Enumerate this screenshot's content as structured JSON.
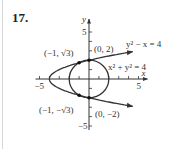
{
  "problem_number": "17.",
  "chart_data": {
    "type": "line",
    "title": "",
    "xlabel": "x",
    "ylabel": "y",
    "xlim": [
      -5,
      5
    ],
    "ylim": [
      -5,
      5
    ],
    "x_ticks": [
      -5,
      -4,
      -3,
      -2,
      -1,
      1,
      2,
      3,
      4,
      5
    ],
    "y_ticks": [
      -5,
      -4,
      -3,
      -2,
      -1,
      1,
      2,
      3,
      4,
      5
    ],
    "x_tick_labels": [
      {
        "value": -5,
        "label": "−5"
      },
      {
        "value": 5,
        "label": "5"
      }
    ],
    "y_tick_labels": [
      {
        "value": 5,
        "label": "5"
      },
      {
        "value": -5,
        "label": "−5"
      }
    ],
    "grid": false,
    "series": [
      {
        "name": "parabola",
        "equation": "y² − x = 4",
        "label": "y² − x = 4",
        "y_range": [
          -2.9,
          2.9
        ],
        "color": "#333333"
      },
      {
        "name": "circle",
        "equation": "x² + y² = 4",
        "label": "x² + y² = 4",
        "radius": 2,
        "color": "#333333"
      }
    ],
    "points": [
      {
        "x": -1,
        "y": 1.732,
        "label": "(−1, √3)"
      },
      {
        "x": 0,
        "y": 2,
        "label": "(0, 2)"
      },
      {
        "x": -1,
        "y": -1.732,
        "label": "(−1, −√3)"
      },
      {
        "x": 0,
        "y": -2,
        "label": "(0, −2)"
      }
    ]
  }
}
